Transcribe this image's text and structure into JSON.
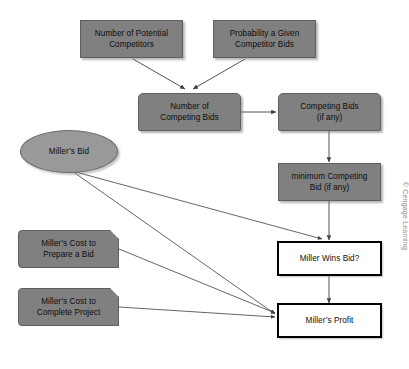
{
  "diagram": {
    "background_color": "#ffffff",
    "node_fill_color": "#808080",
    "ellipse_fill_color": "#999999",
    "outcome_border_color": "#000000",
    "edge_color": "#3f3f3f",
    "nodes": [
      {
        "id": "potential_competitors",
        "label": "Number of Potential\nCompetitors",
        "shape": "rectangle"
      },
      {
        "id": "probability_bids",
        "label": "Probability a Given\nCompetitor Bids",
        "shape": "rectangle"
      },
      {
        "id": "number_competing_bids",
        "label": "Number of\nCompeting Bids",
        "shape": "rounded-rectangle"
      },
      {
        "id": "competing_bids",
        "label": "Competing Bids\n(if any)",
        "shape": "rounded-rectangle"
      },
      {
        "id": "minimum_competing_bid",
        "label": "minimum Competing\nBid (if any)",
        "shape": "rectangle"
      },
      {
        "id": "millers_bid",
        "label": "Miller’s Bid",
        "shape": "ellipse"
      },
      {
        "id": "cost_prepare_bid",
        "label": "Miller’s Cost to\nPrepare a Bid",
        "shape": "chamfered-rectangle"
      },
      {
        "id": "cost_complete_project",
        "label": "Miller’s Cost to\nComplete Project",
        "shape": "chamfered-rectangle"
      },
      {
        "id": "miller_wins_bid",
        "label": "Miller Wins Bid?",
        "shape": "outcome-rectangle"
      },
      {
        "id": "millers_profit",
        "label": "Miller’s Profit",
        "shape": "outcome-rectangle"
      }
    ],
    "edges": [
      {
        "from": "potential_competitors",
        "to": "number_competing_bids"
      },
      {
        "from": "probability_bids",
        "to": "number_competing_bids"
      },
      {
        "from": "number_competing_bids",
        "to": "competing_bids"
      },
      {
        "from": "competing_bids",
        "to": "minimum_competing_bid"
      },
      {
        "from": "minimum_competing_bid",
        "to": "miller_wins_bid"
      },
      {
        "from": "millers_bid",
        "to": "miller_wins_bid"
      },
      {
        "from": "millers_bid",
        "to": "millers_profit"
      },
      {
        "from": "cost_prepare_bid",
        "to": "millers_profit"
      },
      {
        "from": "cost_complete_project",
        "to": "millers_profit"
      },
      {
        "from": "miller_wins_bid",
        "to": "millers_profit"
      }
    ]
  },
  "footer": {
    "copyright": "© Cengage Learning"
  }
}
